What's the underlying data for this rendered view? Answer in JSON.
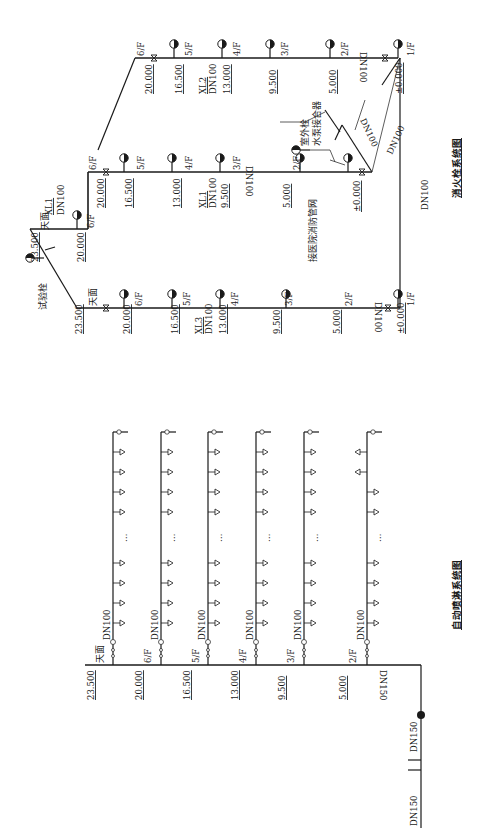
{
  "hydrant_system": {
    "title": "消火栓系统图",
    "test_hydrant_label": "试验栓",
    "roof_label": "天面",
    "outdoor_hydrant_label": "室外栓",
    "pump_adapter_label": "水泵接合器",
    "connect_label": "接医院消防管网",
    "risers": [
      {
        "id": "XL3",
        "size": "DN100",
        "bottom_pipe": "DN100"
      },
      {
        "id": "XL1",
        "size": "DN100",
        "bottom_pipe": "DN100"
      },
      {
        "id": "XL2",
        "size": "DN100",
        "bottom_pipe": "DN100"
      }
    ],
    "roof_riser": {
      "id": "XL1",
      "size": "DN100"
    },
    "connector_pipes": [
      "DN100",
      "DN100",
      "DN100"
    ],
    "main_pipe": "DN100",
    "floors": [
      {
        "label": "1/F",
        "elev": "±0.000"
      },
      {
        "label": "2/F",
        "elev": "5.000"
      },
      {
        "label": "3/F",
        "elev": "9.500"
      },
      {
        "label": "4/F",
        "elev": "13.000"
      },
      {
        "label": "5/F",
        "elev": "16.500"
      },
      {
        "label": "6/F",
        "elev": "20.000"
      }
    ],
    "roof_elev": "23.500",
    "roof_level_elev": "20.000"
  },
  "sprinkler_system": {
    "title": "自动喷淋系统图",
    "roof_label": "天面",
    "roof_elev": "23.500",
    "branch_size": "DN100",
    "riser_size": "DN150",
    "inlet_sizes": [
      "DN150",
      "DN150"
    ],
    "ellipsis": "…",
    "floors": [
      {
        "label": "6/F",
        "elev": "20.000"
      },
      {
        "label": "5/F",
        "elev": "16.500"
      },
      {
        "label": "4/F",
        "elev": "13.000"
      },
      {
        "label": "3/F",
        "elev": "9.500"
      },
      {
        "label": "2/F",
        "elev": "5.000"
      }
    ]
  }
}
